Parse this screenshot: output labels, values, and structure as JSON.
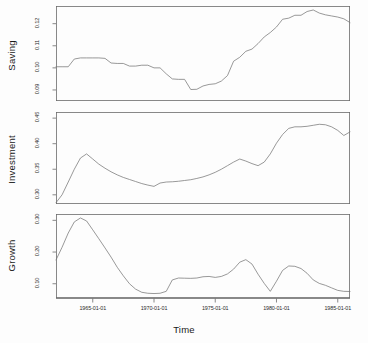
{
  "figure": {
    "xlabel": "Time",
    "panels": [
      "Saving",
      "Investment",
      "Growth"
    ]
  },
  "chart_data": [
    {
      "type": "line",
      "title": "Saving",
      "ylabel": "Saving",
      "xlabel": "",
      "grid": false,
      "legend": null,
      "xlim": [
        "1962-01-01",
        "1986-01-01"
      ],
      "ylim": [
        0.085,
        0.128
      ],
      "xticks": [
        "1965-01-01",
        "1970-01-01",
        "1975-01-01",
        "1980-01-01",
        "1985-01-01"
      ],
      "yticks": [
        0.09,
        0.1,
        0.11,
        0.12
      ],
      "ytick_labels": [
        "0.09",
        "0.10",
        "0.11",
        "0.12"
      ],
      "x": [
        "1962-01-01",
        "1962-07-01",
        "1963-01-01",
        "1963-07-01",
        "1964-01-01",
        "1964-07-01",
        "1965-01-01",
        "1965-07-01",
        "1966-01-01",
        "1966-07-01",
        "1967-01-01",
        "1967-07-01",
        "1968-01-01",
        "1968-07-01",
        "1969-01-01",
        "1969-07-01",
        "1970-01-01",
        "1970-07-01",
        "1971-01-01",
        "1971-07-01",
        "1972-01-01",
        "1972-07-01",
        "1973-01-01",
        "1973-07-01",
        "1974-01-01",
        "1974-07-01",
        "1975-01-01",
        "1975-07-01",
        "1976-01-01",
        "1976-07-01",
        "1977-01-01",
        "1977-07-01",
        "1978-01-01",
        "1978-07-01",
        "1979-01-01",
        "1979-07-01",
        "1980-01-01",
        "1980-07-01",
        "1981-01-01",
        "1981-07-01",
        "1982-01-01",
        "1982-07-01",
        "1983-01-01",
        "1983-07-01",
        "1984-01-01",
        "1984-07-01",
        "1985-01-01",
        "1985-07-01",
        "1986-01-01"
      ],
      "values": [
        0.1005,
        0.1005,
        0.1005,
        0.104,
        0.1045,
        0.1045,
        0.1045,
        0.1045,
        0.1043,
        0.1022,
        0.102,
        0.102,
        0.1008,
        0.1008,
        0.1012,
        0.1012,
        0.1,
        0.1,
        0.0973,
        0.095,
        0.0948,
        0.0948,
        0.0902,
        0.0903,
        0.0918,
        0.0925,
        0.0928,
        0.094,
        0.0965,
        0.103,
        0.1048,
        0.1075,
        0.1085,
        0.111,
        0.114,
        0.116,
        0.1185,
        0.122,
        0.1225,
        0.1238,
        0.1238,
        0.1255,
        0.1262,
        0.1248,
        0.124,
        0.1235,
        0.123,
        0.1222,
        0.1205
      ]
    },
    {
      "type": "line",
      "title": "Investment",
      "ylabel": "Investment",
      "xlabel": "",
      "grid": false,
      "legend": null,
      "xlim": [
        "1962-01-01",
        "1986-01-01"
      ],
      "ylim": [
        0.282,
        0.462
      ],
      "xticks": [
        "1965-01-01",
        "1970-01-01",
        "1975-01-01",
        "1980-01-01",
        "1985-01-01"
      ],
      "yticks": [
        0.3,
        0.35,
        0.4,
        0.45
      ],
      "ytick_labels": [
        "0.30",
        "0.35",
        "0.40",
        "0.45"
      ],
      "x": [
        "1962-01-01",
        "1962-07-01",
        "1963-01-01",
        "1963-07-01",
        "1964-01-01",
        "1964-07-01",
        "1965-01-01",
        "1965-07-01",
        "1966-01-01",
        "1966-07-01",
        "1967-01-01",
        "1967-07-01",
        "1968-01-01",
        "1968-07-01",
        "1969-01-01",
        "1969-07-01",
        "1970-01-01",
        "1970-07-01",
        "1971-01-01",
        "1971-07-01",
        "1972-01-01",
        "1972-07-01",
        "1973-01-01",
        "1973-07-01",
        "1974-01-01",
        "1974-07-01",
        "1975-01-01",
        "1975-07-01",
        "1976-01-01",
        "1976-07-01",
        "1977-01-01",
        "1977-07-01",
        "1978-01-01",
        "1978-07-01",
        "1979-01-01",
        "1979-07-01",
        "1980-01-01",
        "1980-07-01",
        "1981-01-01",
        "1981-07-01",
        "1982-01-01",
        "1982-07-01",
        "1983-01-01",
        "1983-07-01",
        "1984-01-01",
        "1984-07-01",
        "1985-01-01",
        "1985-07-01",
        "1986-01-01"
      ],
      "values": [
        0.2845,
        0.3,
        0.325,
        0.35,
        0.372,
        0.38,
        0.37,
        0.36,
        0.352,
        0.345,
        0.339,
        0.334,
        0.33,
        0.326,
        0.322,
        0.319,
        0.3165,
        0.323,
        0.325,
        0.3255,
        0.3265,
        0.328,
        0.3295,
        0.332,
        0.335,
        0.339,
        0.344,
        0.35,
        0.357,
        0.364,
        0.37,
        0.366,
        0.361,
        0.357,
        0.364,
        0.38,
        0.401,
        0.418,
        0.43,
        0.433,
        0.433,
        0.434,
        0.436,
        0.438,
        0.437,
        0.433,
        0.426,
        0.416,
        0.423
      ]
    },
    {
      "type": "line",
      "title": "Growth",
      "ylabel": "Growth",
      "xlabel": "Time",
      "grid": false,
      "legend": null,
      "xlim": [
        "1962-01-01",
        "1986-01-01"
      ],
      "ylim": [
        0.055,
        0.32
      ],
      "xticks": [
        "1965-01-01",
        "1970-01-01",
        "1975-01-01",
        "1980-01-01",
        "1985-01-01"
      ],
      "yticks": [
        0.1,
        0.2,
        0.3
      ],
      "ytick_labels": [
        "0.10",
        "0.20",
        "0.30"
      ],
      "x": [
        "1962-01-01",
        "1962-07-01",
        "1963-01-01",
        "1963-07-01",
        "1964-01-01",
        "1964-07-01",
        "1965-01-01",
        "1965-07-01",
        "1966-01-01",
        "1966-07-01",
        "1967-01-01",
        "1967-07-01",
        "1968-01-01",
        "1968-07-01",
        "1969-01-01",
        "1969-07-01",
        "1970-01-01",
        "1970-07-01",
        "1971-01-01",
        "1971-07-01",
        "1972-01-01",
        "1972-07-01",
        "1973-01-01",
        "1973-07-01",
        "1974-01-01",
        "1974-07-01",
        "1975-01-01",
        "1975-07-01",
        "1976-01-01",
        "1976-07-01",
        "1977-01-01",
        "1977-07-01",
        "1978-01-01",
        "1978-07-01",
        "1979-01-01",
        "1979-07-01",
        "1980-01-01",
        "1980-07-01",
        "1981-01-01",
        "1981-07-01",
        "1982-01-01",
        "1982-07-01",
        "1983-01-01",
        "1983-07-01",
        "1984-01-01",
        "1984-07-01",
        "1985-01-01",
        "1985-07-01",
        "1986-01-01"
      ],
      "values": [
        0.175,
        0.215,
        0.26,
        0.295,
        0.3075,
        0.298,
        0.27,
        0.242,
        0.213,
        0.184,
        0.152,
        0.125,
        0.1,
        0.083,
        0.073,
        0.07,
        0.069,
        0.07,
        0.076,
        0.112,
        0.118,
        0.1175,
        0.117,
        0.118,
        0.122,
        0.123,
        0.12,
        0.123,
        0.131,
        0.146,
        0.168,
        0.176,
        0.162,
        0.13,
        0.101,
        0.076,
        0.108,
        0.142,
        0.156,
        0.155,
        0.148,
        0.133,
        0.112,
        0.101,
        0.095,
        0.087,
        0.079,
        0.076,
        0.0755
      ]
    }
  ]
}
